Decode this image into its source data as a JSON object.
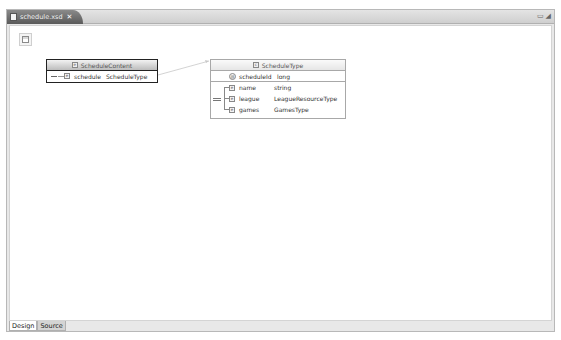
{
  "editor": {
    "tab_label": "schedule.xsd",
    "close_glyph": "✕",
    "window_controls": [
      "▭",
      "◢"
    ]
  },
  "diagram": {
    "outline_button": "outline-view",
    "boxes": [
      {
        "title": "ScheduleContent",
        "rows": [
          {
            "kind": "element",
            "name": "schedule",
            "type": "ScheduleType"
          }
        ]
      },
      {
        "title": "ScheduleType",
        "attributes": [
          {
            "name": "scheduleId",
            "type": "long"
          }
        ],
        "sequence": [
          {
            "name": "name",
            "type": "string"
          },
          {
            "name": "league",
            "type": "LeagueResourceType"
          },
          {
            "name": "games",
            "type": "GamesType"
          }
        ]
      }
    ],
    "icon_glyphs": {
      "element": "e",
      "attribute": "@",
      "complex": "c"
    }
  },
  "bottom_tabs": [
    {
      "label": "Design",
      "active": true
    },
    {
      "label": "Source",
      "active": false
    }
  ]
}
